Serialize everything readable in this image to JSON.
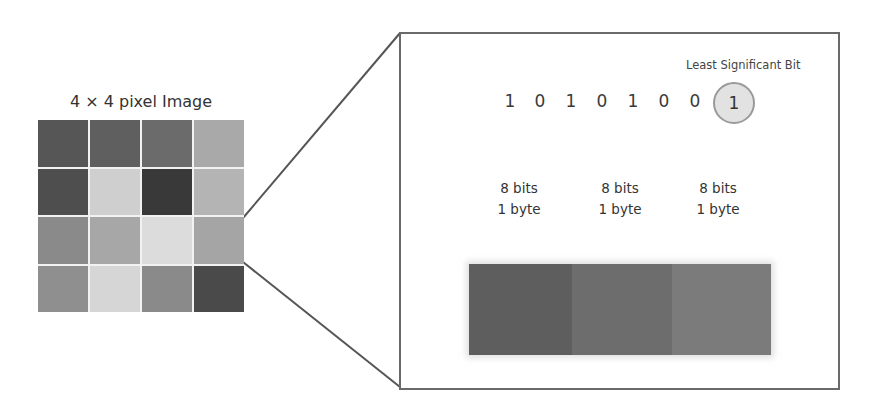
{
  "pixel_image": {
    "title": "4 × 4 pixel Image",
    "rows": 4,
    "cols": 4,
    "cells": [
      [
        "#565656",
        "#5f5f5f",
        "#6b6b6b",
        "#a9a9a9"
      ],
      [
        "#4e4e4e",
        "#cfcfcf",
        "#393939",
        "#b4b4b4"
      ],
      [
        "#8a8a8a",
        "#a7a7a7",
        "#dcdcdc",
        "#a5a5a5"
      ],
      [
        "#8f8f8f",
        "#d6d6d6",
        "#8a8a8a",
        "#4a4a4a"
      ]
    ]
  },
  "zoom_panel": {
    "lsb_label": "Least Significant Bit",
    "bits": [
      "1",
      "0",
      "1",
      "0",
      "1",
      "0",
      "0"
    ],
    "lsb_bit": "1",
    "bytes": [
      {
        "bits_label": "8 bits",
        "byte_label": "1 byte",
        "color": "#5e5e5e"
      },
      {
        "bits_label": "8 bits",
        "byte_label": "1 byte",
        "color": "#6d6d6d"
      },
      {
        "bits_label": "8 bits",
        "byte_label": "1 byte",
        "color": "#7b7b7b"
      }
    ]
  },
  "colors": {
    "line": "#555555",
    "box_border": "#6a6a6a",
    "arrow": "#8a8a8a",
    "lsb_fill": "#e2e2e2",
    "lsb_border": "#9a9a9a"
  }
}
